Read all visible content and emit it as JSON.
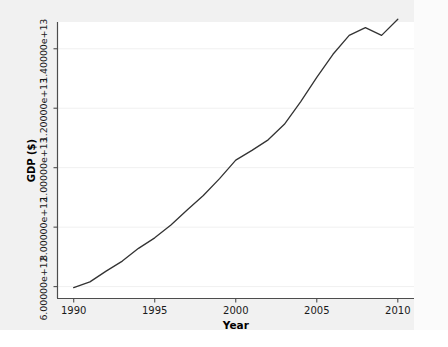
{
  "chart_data": {
    "type": "line",
    "title": "",
    "xlabel": "Year",
    "ylabel": "GDP ($)",
    "xlim": [
      1989.0,
      2011.0
    ],
    "ylim": [
      5600000000000,
      14900000000000
    ],
    "grid": true,
    "legend": null,
    "xticks": [
      "1990",
      "1995",
      "2000",
      "2005",
      "2010"
    ],
    "xtick_values": [
      1990,
      1995,
      2000,
      2005,
      2010
    ],
    "yticks": [
      "6.00000e+12",
      "8.00000e+12",
      "1.00000e+13",
      "1.20000e+13",
      "1.40000e+13"
    ],
    "ytick_values": [
      6000000000000,
      8000000000000,
      10000000000000,
      12000000000000,
      14000000000000
    ],
    "line_color": "#333333",
    "series": [
      {
        "name": "GDP",
        "x": [
          1990,
          1991,
          1992,
          1993,
          1994,
          1995,
          1996,
          1997,
          1998,
          1999,
          2000,
          2001,
          2002,
          2003,
          2004,
          2005,
          2006,
          2007,
          2008,
          2009,
          2010
        ],
        "values": [
          5963100000000,
          6158100000000,
          6520300000000,
          6858600000000,
          7287200000000,
          7639700000000,
          8073100000000,
          8577600000000,
          9062800000000,
          9630700000000,
          10252300000000,
          10581800000000,
          10936400000000,
          11458200000000,
          12213700000000,
          13036600000000,
          13814600000000,
          14451900000000,
          14712800000000,
          14448900000000,
          14992100000000
        ]
      }
    ]
  },
  "axes": {
    "y_title": "GDP ($)",
    "x_title": "Year",
    "y_labels": [
      "6.00000e+12",
      "8.00000e+12",
      "1.00000e+13",
      "1.20000e+13",
      "1.40000e+13"
    ],
    "x_labels": [
      "1990",
      "1995",
      "2000",
      "2005",
      "2010"
    ]
  }
}
